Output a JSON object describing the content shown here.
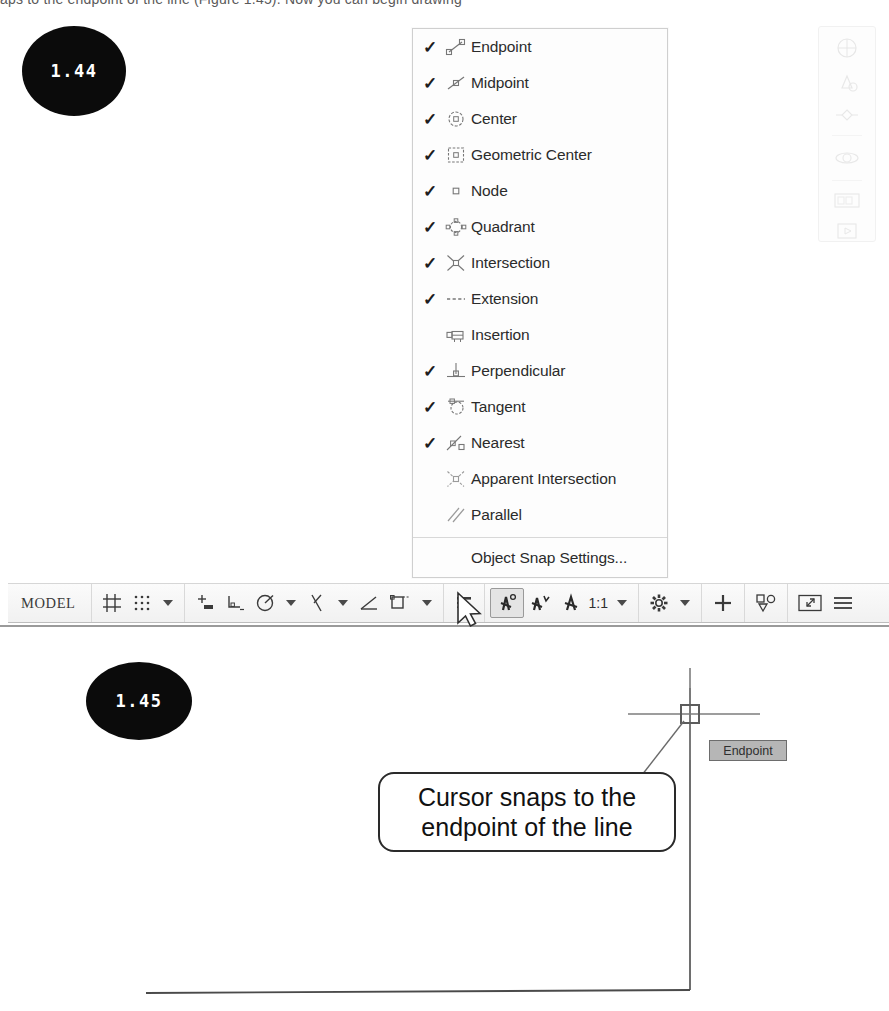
{
  "page": {
    "top_text_fragment": "aps to the endpoint of the line (Figure 1.45). Now you can begin drawing"
  },
  "figures": [
    {
      "id": "fig-1-44",
      "number": "1.44"
    },
    {
      "id": "fig-1-45",
      "number": "1.45"
    }
  ],
  "osnap_menu": {
    "name": "Object Snap context menu",
    "items": [
      {
        "label": "Endpoint",
        "checked": true,
        "icon": "endpoint-snap-icon"
      },
      {
        "label": "Midpoint",
        "checked": true,
        "icon": "midpoint-snap-icon"
      },
      {
        "label": "Center",
        "checked": true,
        "icon": "center-snap-icon"
      },
      {
        "label": "Geometric Center",
        "checked": true,
        "icon": "geometric-center-snap-icon"
      },
      {
        "label": "Node",
        "checked": true,
        "icon": "node-snap-icon"
      },
      {
        "label": "Quadrant",
        "checked": true,
        "icon": "quadrant-snap-icon"
      },
      {
        "label": "Intersection",
        "checked": true,
        "icon": "intersection-snap-icon"
      },
      {
        "label": "Extension",
        "checked": true,
        "icon": "extension-snap-icon"
      },
      {
        "label": "Insertion",
        "checked": false,
        "icon": "insertion-snap-icon"
      },
      {
        "label": "Perpendicular",
        "checked": true,
        "icon": "perpendicular-snap-icon"
      },
      {
        "label": "Tangent",
        "checked": true,
        "icon": "tangent-snap-icon"
      },
      {
        "label": "Nearest",
        "checked": true,
        "icon": "nearest-snap-icon"
      },
      {
        "label": "Apparent Intersection",
        "checked": false,
        "icon": "apparent-intersection-snap-icon"
      },
      {
        "label": "Parallel",
        "checked": false,
        "icon": "parallel-snap-icon"
      }
    ],
    "check_glyph": "✓",
    "settings_item": "Object Snap Settings..."
  },
  "status_bar": {
    "model_label": "MODEL",
    "scale_label": "1:1",
    "items": [
      {
        "name": "model-space-button",
        "label": "MODEL"
      },
      {
        "name": "display-grid-button",
        "label": ""
      },
      {
        "name": "snap-mode-button",
        "label": ""
      },
      {
        "name": "snap-mode-dropdown",
        "label": ""
      },
      {
        "name": "infer-constraints-button",
        "label": ""
      },
      {
        "name": "ortho-mode-button",
        "label": ""
      },
      {
        "name": "polar-tracking-button",
        "label": ""
      },
      {
        "name": "polar-tracking-dropdown",
        "label": ""
      },
      {
        "name": "isometric-drafting-button",
        "label": ""
      },
      {
        "name": "isometric-drafting-dropdown",
        "label": ""
      },
      {
        "name": "object-snap-tracking-button",
        "label": ""
      },
      {
        "name": "2d-object-snap-button",
        "label": ""
      },
      {
        "name": "2d-object-snap-dropdown",
        "label": ""
      },
      {
        "name": "lineweight-button",
        "label": ""
      },
      {
        "name": "transparency-button",
        "label": ""
      },
      {
        "name": "selection-cycling-button",
        "label": ""
      },
      {
        "name": "3d-object-snap-button",
        "label": ""
      },
      {
        "name": "annotation-scale-button",
        "label": "1:1"
      },
      {
        "name": "annotation-scale-dropdown",
        "label": ""
      },
      {
        "name": "workspace-switching-button",
        "label": ""
      },
      {
        "name": "workspace-dropdown",
        "label": ""
      },
      {
        "name": "annotation-monitor-button",
        "label": ""
      },
      {
        "name": "units-button",
        "label": ""
      },
      {
        "name": "clean-screen-button",
        "label": ""
      },
      {
        "name": "customization-button",
        "label": ""
      }
    ],
    "active_item": "2d-object-snap-button"
  },
  "drawing": {
    "callout_line_1": "Cursor snaps to the",
    "callout_line_2": "endpoint of the line",
    "endpoint_tooltip": "Endpoint"
  },
  "colors": {
    "menu_background": "#fdfdfd",
    "menu_border": "#cfcfcf",
    "text": "#2b2b2b",
    "icon_gray": "#6f6f6f",
    "bubble_fill": "#0b0b0b",
    "bubble_text": "#ffffff",
    "tooltip_fill": "#b6b6b6",
    "tooltip_border": "#6d6d6d",
    "status_bar_bg": "#f4f4f4",
    "drawing_line": "#4a4a4a"
  }
}
